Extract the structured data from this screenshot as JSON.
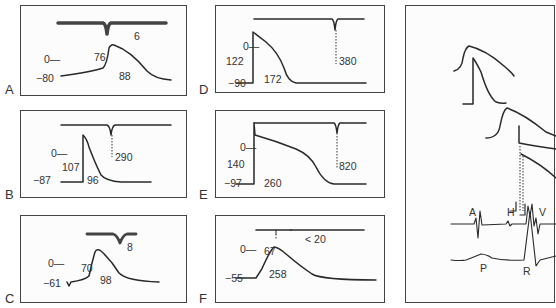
{
  "figure": {
    "panels": [
      {
        "id": "A",
        "letter": "A",
        "zero_label": "0—",
        "resting_label": "−80",
        "amplitude": "76",
        "duration": "88",
        "conduction": "6"
      },
      {
        "id": "B",
        "letter": "B",
        "zero_label": "0—",
        "resting_label": "−87",
        "amplitude": "107",
        "duration": "96",
        "conduction": "290"
      },
      {
        "id": "C",
        "letter": "C",
        "zero_label": "0—",
        "resting_label": "−61",
        "amplitude": "70",
        "duration": "98",
        "conduction": "8"
      },
      {
        "id": "D",
        "letter": "D",
        "zero_label": "0—",
        "resting_label": "−90",
        "amplitude": "122",
        "duration": "172",
        "conduction": "380"
      },
      {
        "id": "E",
        "letter": "E",
        "zero_label": "0—",
        "resting_label": "−97",
        "amplitude": "140",
        "duration": "260",
        "conduction": "820"
      },
      {
        "id": "F",
        "letter": "F",
        "zero_label": "0—",
        "resting_label": "−55",
        "amplitude": "67",
        "duration": "258",
        "conduction": "< 20"
      }
    ],
    "composite": {
      "his_labels": {
        "a": "A",
        "h": "H",
        "v": "V"
      },
      "ecg_labels": {
        "p": "P",
        "r": "R"
      }
    }
  }
}
